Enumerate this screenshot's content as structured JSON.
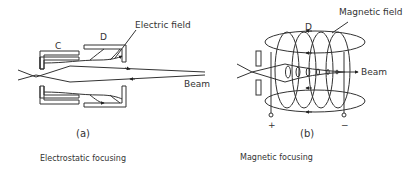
{
  "panel_a": {
    "electrode_c": "C",
    "electrode_d": "D",
    "field_label": "Electric field",
    "beam_label": "Beam",
    "sublabel": "(a)",
    "caption": "Electrostatic focusing"
  },
  "panel_b": {
    "coil_label": "D",
    "field_label": "Magnetic field",
    "beam_label": "Beam",
    "terminal_plus": "+",
    "terminal_minus": "−",
    "sublabel": "(b)",
    "caption": "Magnetic focusing"
  }
}
